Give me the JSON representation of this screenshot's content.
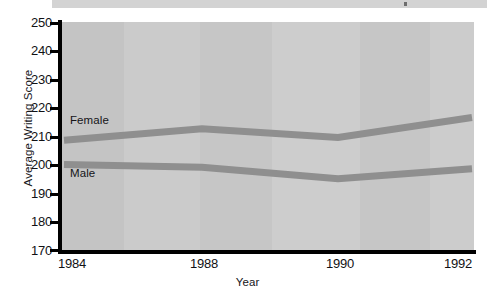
{
  "chart_data": {
    "type": "line",
    "title": "",
    "xlabel": "Year",
    "ylabel": "Average Writing Score",
    "x": [
      "1984",
      "1988",
      "1990",
      "1992"
    ],
    "xtick_labels": [
      "1984",
      "1988",
      "1990",
      "1992"
    ],
    "ytick_labels": [
      "250",
      "240",
      "230",
      "220",
      "210",
      "200",
      "190",
      "180",
      "170"
    ],
    "ylim": [
      170,
      250
    ],
    "ytick_step": 10,
    "grid": false,
    "legend_position": "inline-labels",
    "series": [
      {
        "name": "Female",
        "label": "Female",
        "color": "#8f8f8f",
        "values": [
          208.5,
          212.5,
          209.5,
          216.5
        ]
      },
      {
        "name": "Male",
        "label": "Male",
        "color": "#8f8f8f",
        "values": [
          200.0,
          199.0,
          195.0,
          198.5
        ]
      }
    ],
    "annotations": [],
    "plot_background_color": "#c9c9c9",
    "axis_color": "#000000",
    "text_color": "#111114"
  }
}
